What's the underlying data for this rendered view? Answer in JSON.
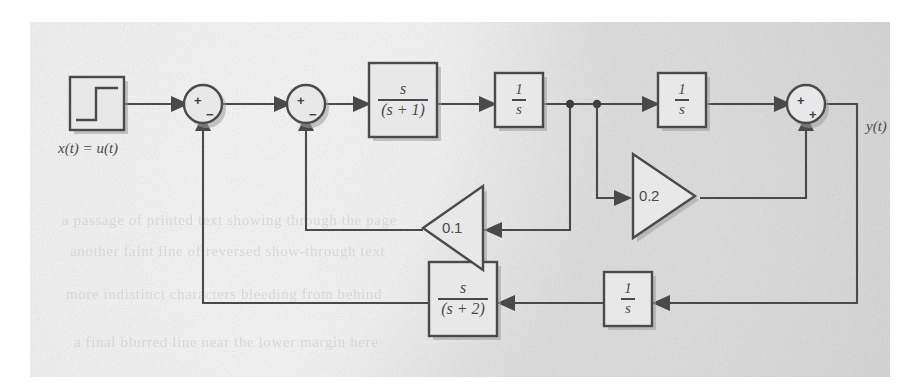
{
  "figure": {
    "kind": "control-system-block-diagram",
    "caption_label": "",
    "panel": {
      "background_color": "#e2e2e2",
      "ink_color": "#4a4a4a"
    }
  },
  "input": {
    "block_name": "step-source",
    "waveform": "unit-step",
    "label": "x(t) = u(t)"
  },
  "output": {
    "label": "y(t)"
  },
  "summing_junctions": [
    {
      "id": "sum1",
      "signs": [
        "+",
        "−"
      ],
      "plus_position": "upper-left",
      "minus_position": "lower-right"
    },
    {
      "id": "sum2",
      "signs": [
        "+",
        "−"
      ],
      "plus_position": "upper-left",
      "minus_position": "lower-right"
    },
    {
      "id": "sum3",
      "signs": [
        "+",
        "+"
      ],
      "plus_position": "upper-left",
      "minus_position": "lower-right"
    }
  ],
  "blocks": [
    {
      "id": "tf1",
      "numerator": "s",
      "denominator": "(s + 1)",
      "type": "fraction"
    },
    {
      "id": "int1",
      "numerator": "1",
      "denominator": "s",
      "type": "fraction"
    },
    {
      "id": "int2",
      "numerator": "1",
      "denominator": "s",
      "type": "fraction"
    },
    {
      "id": "tf2",
      "numerator": "s",
      "denominator": "(s + 2)",
      "type": "fraction"
    },
    {
      "id": "int3",
      "numerator": "1",
      "denominator": "s",
      "type": "fraction"
    }
  ],
  "gains": [
    {
      "id": "gain-0-1",
      "value": "0.1",
      "direction": "left"
    },
    {
      "id": "gain-0-2",
      "value": "0.2",
      "direction": "right"
    }
  ],
  "bleed_text": [
    {
      "text": "a passage of printed text showing through the page",
      "x": 62,
      "y": 212
    },
    {
      "text": "another faint line of reversed show-through text",
      "x": 70,
      "y": 243
    },
    {
      "text": "more indistinct characters bleeding from behind",
      "x": 66,
      "y": 286
    },
    {
      "text": "a final blurred line near the lower margin here",
      "x": 74,
      "y": 334
    }
  ]
}
